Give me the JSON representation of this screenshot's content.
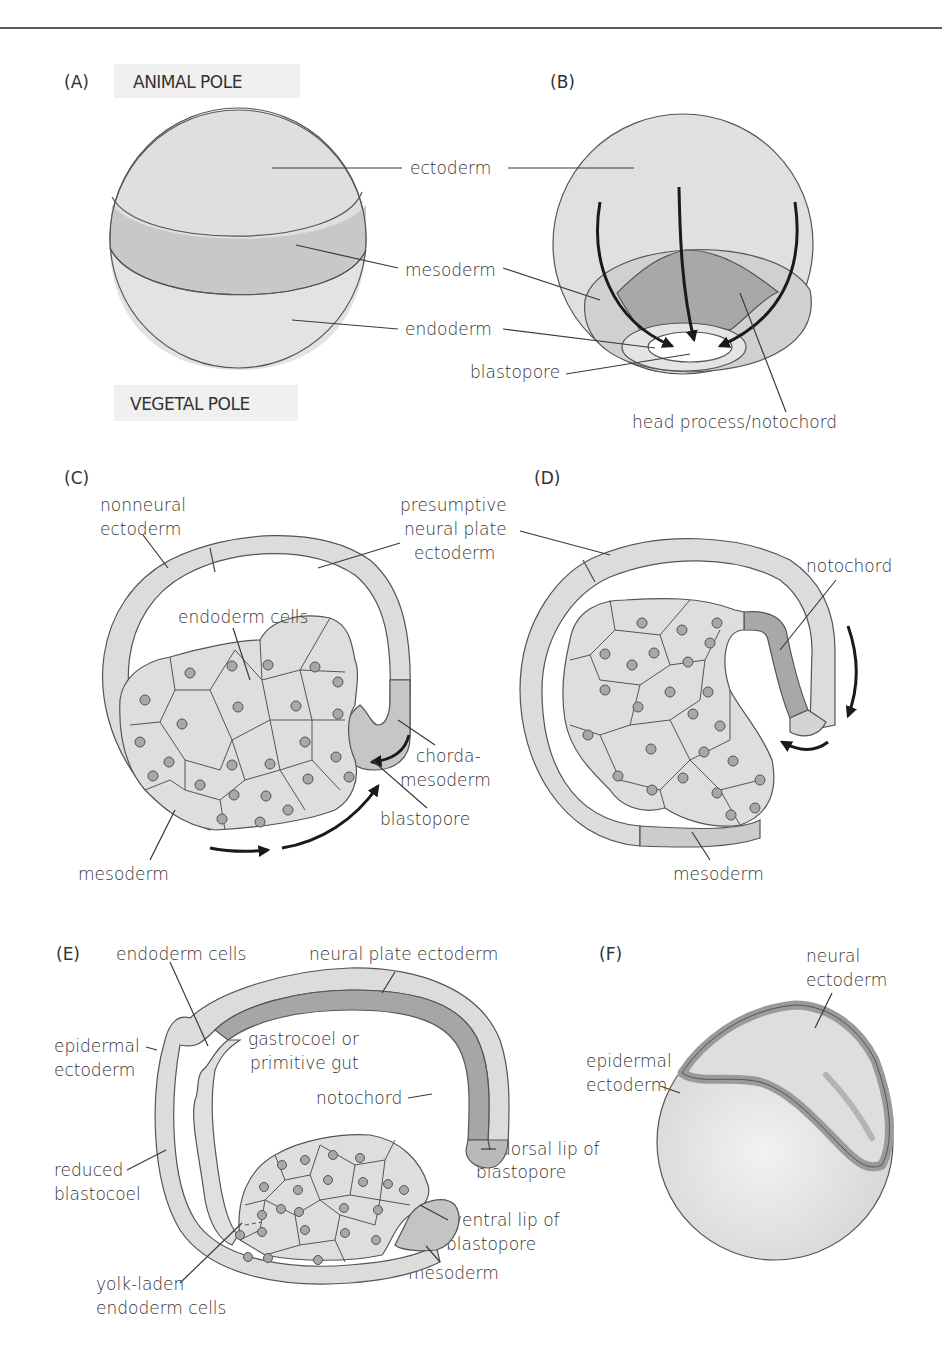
{
  "figure": {
    "colors": {
      "ectoderm_light": "#e2e2e2",
      "mesoderm_mid": "#c9c9c9",
      "notochord_dark": "#a3a3a3",
      "endoderm_light": "#e6e6e6",
      "outline": "#555555",
      "arrow": "#1a1a1a",
      "pole_label_bg": "#f0f0f0"
    },
    "panels": [
      {
        "id": "A",
        "label": "(A)",
        "pole_top": "ANIMAL POLE",
        "pole_bottom": "VEGETAL POLE"
      },
      {
        "id": "B",
        "label": "(B)",
        "labels": [
          "ectoderm",
          "mesoderm",
          "endoderm",
          "blastopore",
          "head process/notochord"
        ]
      },
      {
        "id": "C",
        "label": "(C)",
        "labels": {
          "nonneural_1": "nonneural",
          "nonneural_2": "ectoderm",
          "presumptive_1": "presumptive",
          "presumptive_2": "neural plate",
          "presumptive_3": "ectoderm",
          "endoderm_cells": "endoderm cells",
          "chorda_1": "chorda-",
          "chorda_2": "mesoderm",
          "blastopore": "blastopore",
          "mesoderm": "mesoderm"
        }
      },
      {
        "id": "D",
        "label": "(D)",
        "labels": {
          "notochord": "notochord",
          "mesoderm": "mesoderm"
        }
      },
      {
        "id": "E",
        "label": "(E)",
        "labels": {
          "endoderm_cells": "endoderm cells",
          "neural_plate": "neural plate ectoderm",
          "epidermal_1": "epidermal",
          "epidermal_2": "ectoderm",
          "gastrocoel_1": "gastrocoel or",
          "gastrocoel_2": "primitive gut",
          "notochord": "notochord",
          "dorsal_lip_1": "dorsal lip of",
          "dorsal_lip_2": "blastopore",
          "reduced_1": "reduced",
          "reduced_2": "blastocoel",
          "ventral_lip_1": "ventral lip of",
          "ventral_lip_2": "blastopore",
          "yolk_1": "yolk-laden",
          "yolk_2": "endoderm cells",
          "mesoderm": "mesoderm"
        }
      },
      {
        "id": "F",
        "label": "(F)",
        "labels": {
          "neural_1": "neural",
          "neural_2": "ectoderm",
          "epidermal_1": "epidermal",
          "epidermal_2": "ectoderm"
        }
      }
    ]
  }
}
